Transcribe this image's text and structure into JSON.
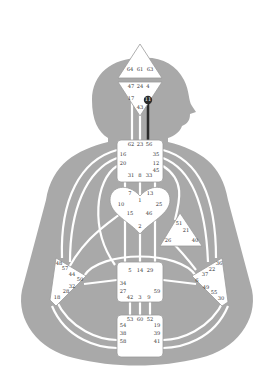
{
  "colors": {
    "silhouette": "#a9a9a9",
    "channel": "#ffffff",
    "center_fill": "#ffffff",
    "center_stroke": "#9a9a9a",
    "defined": "#2b2b2b",
    "gate_text": "#333333"
  },
  "centers": {
    "head": {
      "gates": [
        "64",
        "61",
        "63"
      ]
    },
    "ajna": {
      "gates": [
        "47",
        "24",
        "4",
        "17",
        "11",
        "43"
      ],
      "highlighted_gate": "11"
    },
    "throat": {
      "gates": [
        "62",
        "23",
        "56",
        "16",
        "35",
        "20",
        "12",
        "45",
        "31",
        "8",
        "33"
      ]
    },
    "g": {
      "gates": [
        "7",
        "1",
        "13",
        "10",
        "25",
        "15",
        "46",
        "2"
      ]
    },
    "heart": {
      "gates": [
        "51",
        "21",
        "26",
        "40"
      ]
    },
    "spleen": {
      "gates": [
        "48",
        "57",
        "44",
        "50",
        "32",
        "28",
        "18"
      ]
    },
    "solar_plexus": {
      "gates": [
        "36",
        "22",
        "37",
        "6",
        "49",
        "55",
        "30"
      ]
    },
    "sacral": {
      "gates": [
        "5",
        "14",
        "29",
        "34",
        "27",
        "59",
        "42",
        "3",
        "9"
      ]
    },
    "root": {
      "gates": [
        "53",
        "60",
        "52",
        "54",
        "19",
        "38",
        "39",
        "58",
        "41"
      ]
    }
  },
  "defined_channels": [
    [
      "11",
      "56"
    ]
  ]
}
